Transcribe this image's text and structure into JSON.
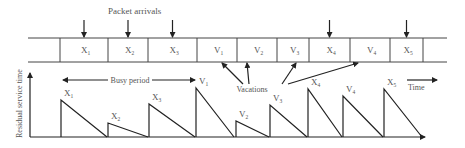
{
  "diagram": {
    "title_label": "Packet arrivals",
    "queue_cells": [
      {
        "label": "",
        "sub": ""
      },
      {
        "label": "X",
        "sub": "1"
      },
      {
        "label": "X",
        "sub": "2"
      },
      {
        "label": "X",
        "sub": "3"
      },
      {
        "label": "V",
        "sub": "1"
      },
      {
        "label": "V",
        "sub": "2"
      },
      {
        "label": "V",
        "sub": "3"
      },
      {
        "label": "X",
        "sub": "4"
      },
      {
        "label": "V",
        "sub": "4"
      },
      {
        "label": "X",
        "sub": "5"
      },
      {
        "label": "",
        "sub": ""
      }
    ],
    "arrival_cells": [
      "X1",
      "X2",
      "X3",
      "X4",
      "X5"
    ],
    "vacations_label": "Vacations",
    "vacation_targets": [
      "V1",
      "V2",
      "V3",
      "V4"
    ],
    "busy_period_label": "Busy period",
    "time_label": "Time",
    "y_axis_label": "Residual service time",
    "pulses": [
      {
        "label": "X",
        "sub": "1",
        "kind": "service"
      },
      {
        "label": "X",
        "sub": "2",
        "kind": "service"
      },
      {
        "label": "X",
        "sub": "3",
        "kind": "service"
      },
      {
        "label": "V",
        "sub": "1",
        "kind": "vacation"
      },
      {
        "label": "V",
        "sub": "2",
        "kind": "vacation"
      },
      {
        "label": "V",
        "sub": "3",
        "kind": "vacation"
      },
      {
        "label": "X",
        "sub": "4",
        "kind": "service"
      },
      {
        "label": "V",
        "sub": "4",
        "kind": "vacation"
      },
      {
        "label": "X",
        "sub": "5",
        "kind": "service"
      }
    ]
  }
}
